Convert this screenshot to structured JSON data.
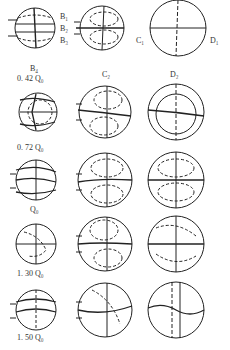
{
  "diagram": {
    "section_labels": {
      "B1": "B₁",
      "B2": "B₂",
      "B3": "B₃",
      "B4": "B₄",
      "C1": "C₁",
      "C2": "C₂",
      "D1": "D₁",
      "D2": "D₂"
    },
    "rows": [
      {
        "flow_label": "0. 42 Q₀"
      },
      {
        "flow_label": "0. 72 Q₀"
      },
      {
        "flow_label": "Q₀"
      },
      {
        "flow_label": "1. 30 Q₀"
      },
      {
        "flow_label": "1. 50 Q₀"
      }
    ],
    "columns": [
      "B section",
      "C section",
      "D section"
    ],
    "colors": {
      "line": "#222222",
      "dashed": "#555555",
      "background": "#ffffff"
    }
  }
}
